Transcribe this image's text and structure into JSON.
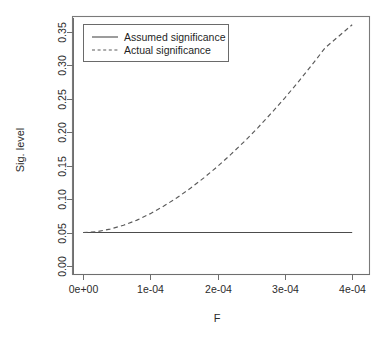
{
  "chart_data": {
    "type": "line",
    "title": "",
    "xlabel": "F",
    "ylabel": "Sig. level",
    "xlim": [
      -1.5e-05,
      0.000425
    ],
    "ylim": [
      -0.012,
      0.372
    ],
    "grid": false,
    "legend_position": "top-left inside plot",
    "x_tick_labels": [
      "0e+00",
      "1e-04",
      "2e-04",
      "3e-04",
      "4e-04"
    ],
    "x_tick_values": [
      0,
      0.0001,
      0.0002,
      0.0003,
      0.0004
    ],
    "y_tick_labels": [
      "0.00",
      "0.05",
      "0.10",
      "0.15",
      "0.20",
      "0.25",
      "0.30",
      "0.35"
    ],
    "y_tick_values": [
      0.0,
      0.05,
      0.1,
      0.15,
      0.2,
      0.25,
      0.3,
      0.35
    ],
    "x": [
      0,
      2e-05,
      4e-05,
      6e-05,
      8e-05,
      0.0001,
      0.00012,
      0.00014,
      0.00016,
      0.00018,
      0.0002,
      0.00022,
      0.00024,
      0.00026,
      0.00028,
      0.0003,
      0.00032,
      0.00034,
      0.00036,
      0.00038,
      0.0004
    ],
    "series": [
      {
        "name": "Assumed significance",
        "style": "solid",
        "color": "#4c4c4c",
        "values": [
          0.05,
          0.05,
          0.05,
          0.05,
          0.05,
          0.05,
          0.05,
          0.05,
          0.05,
          0.05,
          0.05,
          0.05,
          0.05,
          0.05,
          0.05,
          0.05,
          0.05,
          0.05,
          0.05,
          0.05,
          0.05
        ]
      },
      {
        "name": "Actual significance",
        "style": "dashed",
        "color": "#5a5a5a",
        "values": [
          0.05,
          0.0512,
          0.055,
          0.0608,
          0.0685,
          0.0782,
          0.0895,
          0.1022,
          0.1165,
          0.132,
          0.1488,
          0.167,
          0.1862,
          0.2068,
          0.2285,
          0.2512,
          0.2752,
          0.3002,
          0.3262,
          0.3432,
          0.3605
        ]
      }
    ],
    "legend_entries": [
      {
        "label": "Assumed significance",
        "style": "solid"
      },
      {
        "label": "Actual significance",
        "style": "dashed"
      }
    ]
  }
}
